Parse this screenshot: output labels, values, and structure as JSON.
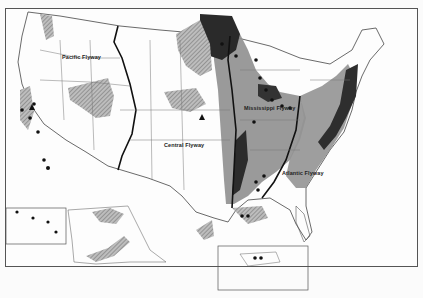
{
  "map": {
    "subject": "Waterfowl flyways of the United States",
    "flyways": [
      {
        "name": "Pacific Flyway",
        "x": 62,
        "y": 56
      },
      {
        "name": "Central Flyway",
        "x": 164,
        "y": 144
      },
      {
        "name": "Mississippi Flyway",
        "x": 246,
        "y": 107
      },
      {
        "name": "Atlantic Flyway",
        "x": 285,
        "y": 171
      }
    ],
    "insets": [
      {
        "name": "Alaska and Hawaii"
      },
      {
        "name": "Puerto Rico"
      }
    ],
    "legend_fills": {
      "dark": "#2a2a2a",
      "medium": "#8c8c8c",
      "hatched": "#a8a8a8",
      "background": "#fdfdfd"
    },
    "symbols": [
      "dot",
      "triangle"
    ]
  }
}
